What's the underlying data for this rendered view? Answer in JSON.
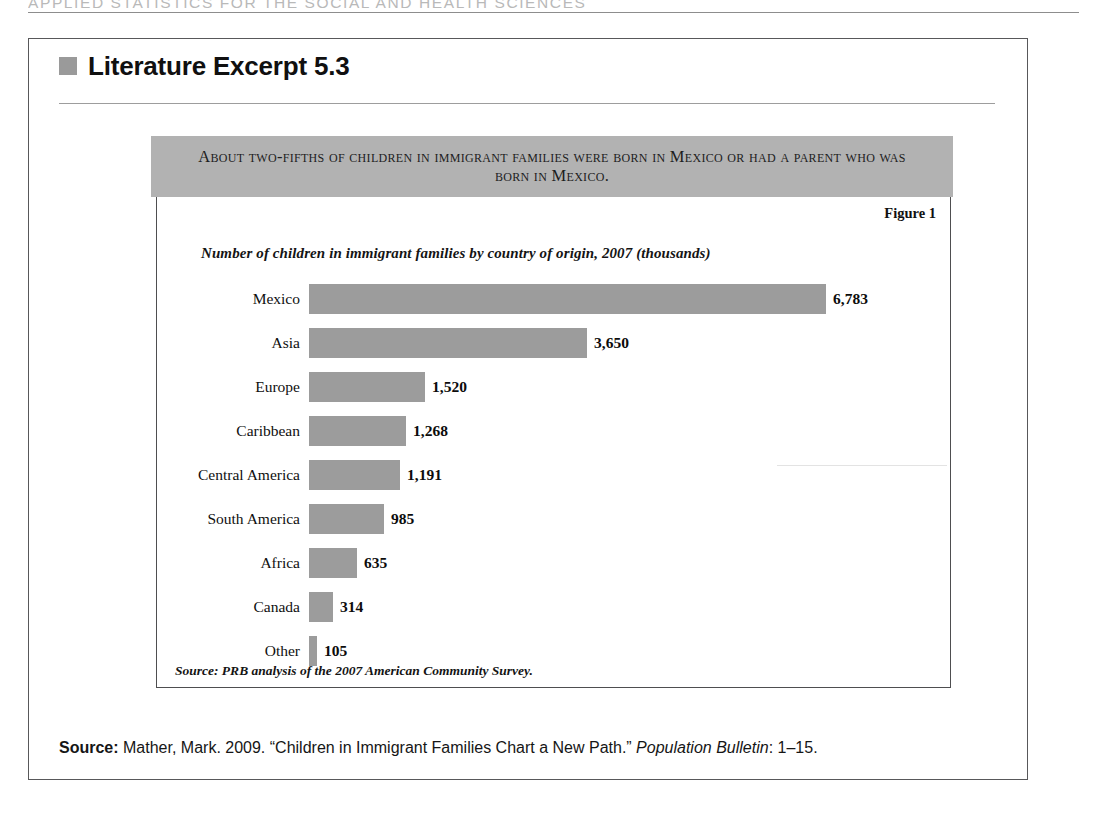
{
  "running_head": {
    "text": "APPLIED STATISTICS FOR THE SOCIAL AND HEALTH SCIENCES"
  },
  "excerpt": {
    "bullet_icon": "gray-square-bullet",
    "title": "Literature Excerpt 5.3",
    "bullet_color": "#9a9a9a"
  },
  "figure": {
    "banner_text": "About two-fifths of children in immigrant families were born in Mexico or had a parent who was born in Mexico.",
    "banner_color": "#b2b2b2",
    "figure_number": "Figure 1",
    "subtitle": "Number of children in immigrant families by country of origin, 2007 (thousands)",
    "chart_source": "Source: PRB analysis of the 2007 American Community Survey."
  },
  "bottom_source": {
    "label": "Source:",
    "text_before_italic": " Mather, Mark. 2009. “Children in Immigrant Families Chart a New Path.” ",
    "italic_text": "Population Bulletin",
    "text_after_italic": ": 1–15."
  },
  "chart_data": {
    "type": "bar",
    "orientation": "horizontal",
    "title": "About two-fifths of children in immigrant families were born in Mexico or had a parent who was born in Mexico.",
    "subtitle": "Number of children in immigrant families by country of origin, 2007 (thousands)",
    "xlabel": "",
    "ylabel": "",
    "units": "thousands",
    "year": 2007,
    "grid": false,
    "legend": false,
    "axis_visible": false,
    "bar_color": "#9c9c9c",
    "xlim": [
      0,
      6783
    ],
    "px_per_unit": 0.0762,
    "categories": [
      "Mexico",
      "Asia",
      "Europe",
      "Caribbean",
      "Central America",
      "South America",
      "Africa",
      "Canada",
      "Other"
    ],
    "values": [
      6783,
      3650,
      1520,
      1268,
      1191,
      985,
      635,
      314,
      105
    ],
    "value_labels": [
      "6,783",
      "3,650",
      "1,520",
      "1,268",
      "1,191",
      "985",
      "635",
      "314",
      "105"
    ],
    "source": "Source: PRB analysis of the 2007 American Community Survey.",
    "bars": [
      {
        "label": "Mexico",
        "value": 6783,
        "value_label": "6,783"
      },
      {
        "label": "Asia",
        "value": 3650,
        "value_label": "3,650"
      },
      {
        "label": "Europe",
        "value": 1520,
        "value_label": "1,520"
      },
      {
        "label": "Caribbean",
        "value": 1268,
        "value_label": "1,268"
      },
      {
        "label": "Central America",
        "value": 1191,
        "value_label": "1,191"
      },
      {
        "label": "South America",
        "value": 985,
        "value_label": "985"
      },
      {
        "label": "Africa",
        "value": 635,
        "value_label": "635"
      },
      {
        "label": "Canada",
        "value": 314,
        "value_label": "314"
      },
      {
        "label": "Other",
        "value": 105,
        "value_label": "105"
      }
    ]
  }
}
